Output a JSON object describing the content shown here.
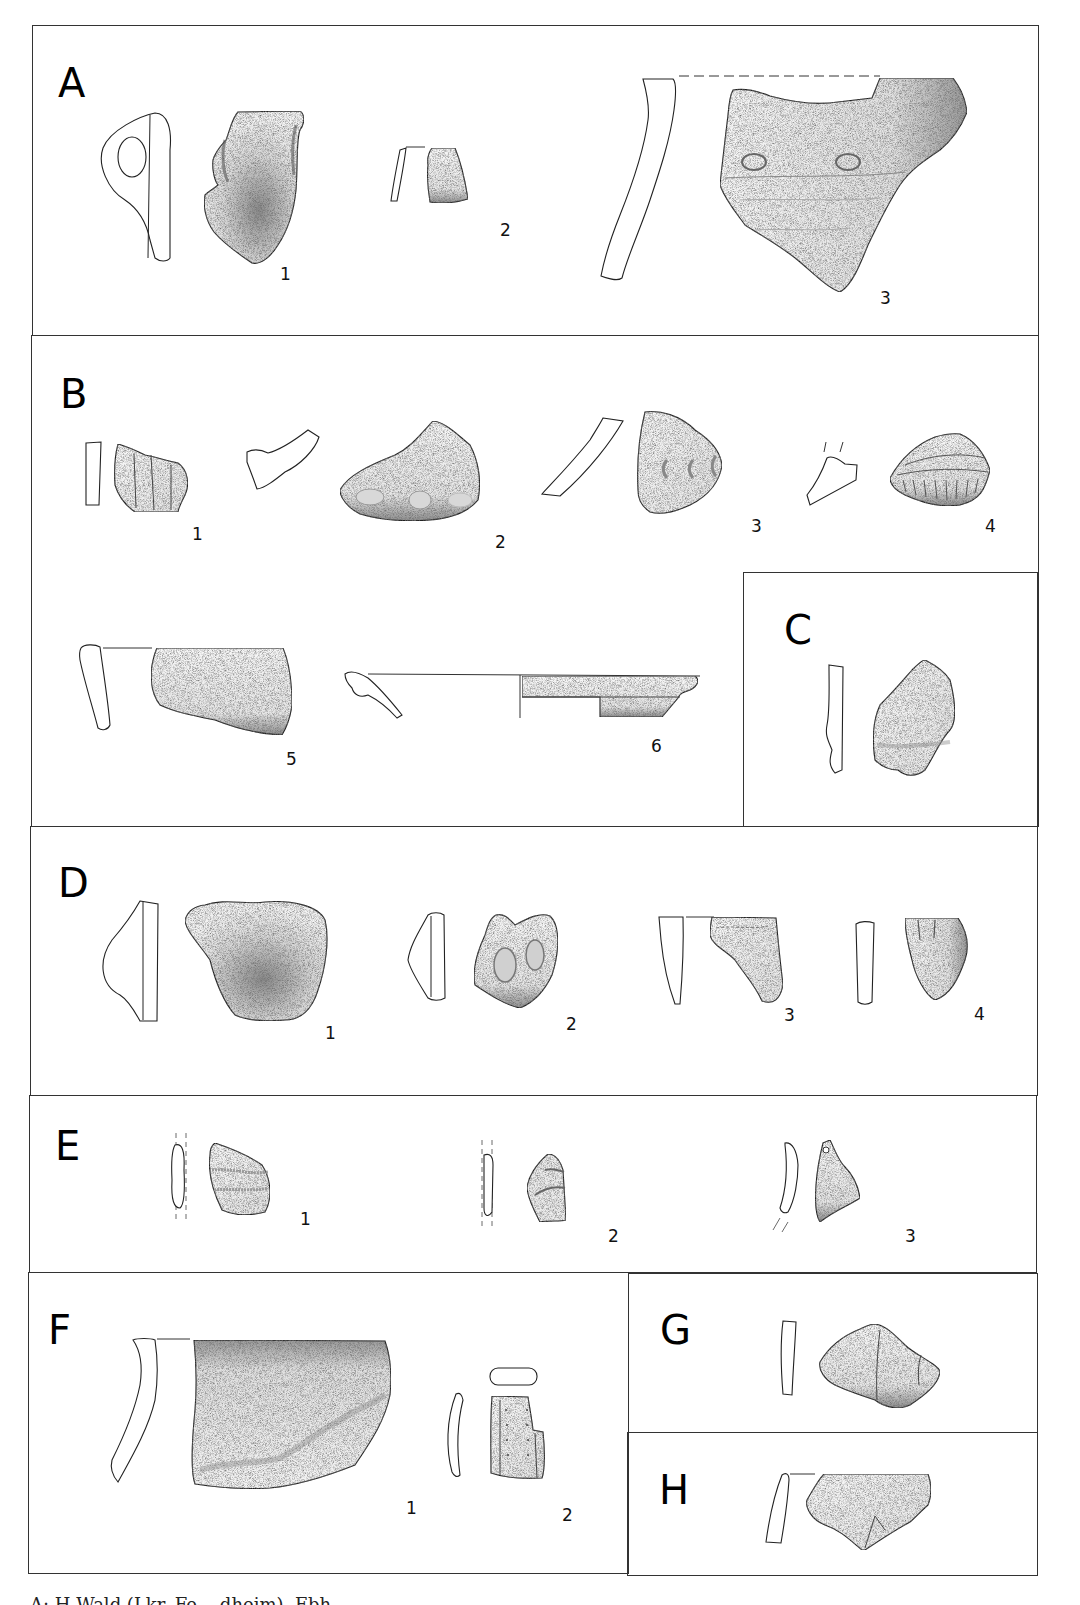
{
  "figure": {
    "panels": [
      {
        "id": "A",
        "letter": "A",
        "items": [
          "1",
          "2",
          "3"
        ]
      },
      {
        "id": "B",
        "letter": "B",
        "items": [
          "1",
          "2",
          "3",
          "4",
          "5",
          "6"
        ]
      },
      {
        "id": "C",
        "letter": "C",
        "items": []
      },
      {
        "id": "D",
        "letter": "D",
        "items": [
          "1",
          "2",
          "3",
          "4"
        ]
      },
      {
        "id": "E",
        "letter": "E",
        "items": [
          "1",
          "2",
          "3"
        ]
      },
      {
        "id": "F",
        "letter": "F",
        "items": [
          "1",
          "2"
        ]
      },
      {
        "id": "G",
        "letter": "G",
        "items": []
      },
      {
        "id": "H",
        "letter": "H",
        "items": []
      }
    ],
    "caption": "A: H.Wald (Lkr. Fe... dheim). Ebh..."
  },
  "style": {
    "border_color": "#333333",
    "ink_color": "#222222",
    "background": "#ffffff"
  }
}
